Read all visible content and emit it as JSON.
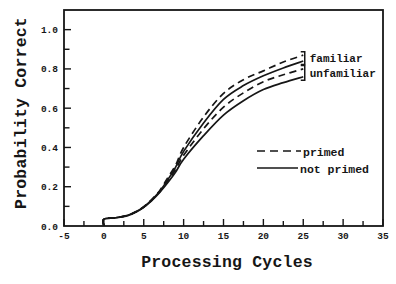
{
  "figure": {
    "background": "#ffffff",
    "ink_color": "#161616"
  },
  "chart_data": {
    "type": "line",
    "title": "",
    "xlabel": "Processing Cycles",
    "ylabel": "Probability Correct",
    "xlim": [
      -5,
      35
    ],
    "ylim": [
      0,
      1.1
    ],
    "x_tick_values": [
      -5,
      0,
      5,
      10,
      15,
      20,
      25,
      30,
      35
    ],
    "x_tick_labels": [
      "-5",
      "0",
      "5",
      "10",
      "15",
      "20",
      "25",
      "30",
      "35"
    ],
    "x_minor_tick_step": 2.5,
    "y_tick_values": [
      0,
      0.2,
      0.4,
      0.6,
      0.8,
      1.0
    ],
    "y_tick_labels": [
      "0.0",
      "0.2",
      "0.4",
      "0.6",
      "0.8",
      "1.0"
    ],
    "y_minor_tick_step": 0.1,
    "grid": false,
    "legend_position": "inside lower right",
    "legend": [
      {
        "label": "primed",
        "style": "dashed"
      },
      {
        "label": "not primed",
        "style": "solid"
      }
    ],
    "annotations": [
      {
        "label": "familiar",
        "bracket": true,
        "groups_series": [
          0,
          1
        ]
      },
      {
        "label": "unfamiliar",
        "bracket": true,
        "groups_series": [
          2,
          3
        ]
      }
    ],
    "series": [
      {
        "name": "familiar primed",
        "familiarity": "familiar",
        "priming": "primed",
        "style": "dashed",
        "points": [
          [
            0,
            0
          ],
          [
            0,
            0.035
          ],
          [
            1.5,
            0.042
          ],
          [
            3,
            0.055
          ],
          [
            4,
            0.072
          ],
          [
            5,
            0.098
          ],
          [
            6,
            0.135
          ],
          [
            7,
            0.18
          ],
          [
            8,
            0.245
          ],
          [
            9,
            0.31
          ],
          [
            10,
            0.4
          ],
          [
            12.5,
            0.555
          ],
          [
            15,
            0.675
          ],
          [
            17.5,
            0.745
          ],
          [
            20,
            0.79
          ],
          [
            22.5,
            0.835
          ],
          [
            25,
            0.87
          ]
        ]
      },
      {
        "name": "familiar not primed",
        "familiarity": "familiar",
        "priming": "not primed",
        "style": "solid",
        "points": [
          [
            0,
            0
          ],
          [
            0,
            0.035
          ],
          [
            1.5,
            0.042
          ],
          [
            3,
            0.055
          ],
          [
            4,
            0.072
          ],
          [
            5,
            0.097
          ],
          [
            6,
            0.133
          ],
          [
            7,
            0.177
          ],
          [
            8,
            0.235
          ],
          [
            9,
            0.3
          ],
          [
            10,
            0.38
          ],
          [
            12.5,
            0.525
          ],
          [
            15,
            0.645
          ],
          [
            17.5,
            0.715
          ],
          [
            20,
            0.765
          ],
          [
            22.5,
            0.805
          ],
          [
            25,
            0.84
          ]
        ]
      },
      {
        "name": "unfamiliar primed",
        "familiarity": "unfamiliar",
        "priming": "primed",
        "style": "dashed",
        "points": [
          [
            0,
            0
          ],
          [
            0,
            0.035
          ],
          [
            1.5,
            0.042
          ],
          [
            3,
            0.054
          ],
          [
            4,
            0.071
          ],
          [
            5,
            0.096
          ],
          [
            6,
            0.131
          ],
          [
            7,
            0.174
          ],
          [
            8,
            0.228
          ],
          [
            9,
            0.288
          ],
          [
            10,
            0.36
          ],
          [
            12.5,
            0.495
          ],
          [
            15,
            0.605
          ],
          [
            17.5,
            0.678
          ],
          [
            20,
            0.735
          ],
          [
            22.5,
            0.77
          ],
          [
            25,
            0.8
          ]
        ]
      },
      {
        "name": "unfamiliar not primed",
        "familiarity": "unfamiliar",
        "priming": "not primed",
        "style": "solid",
        "points": [
          [
            0,
            0
          ],
          [
            0,
            0.035
          ],
          [
            1.5,
            0.042
          ],
          [
            3,
            0.053
          ],
          [
            4,
            0.07
          ],
          [
            5,
            0.095
          ],
          [
            6,
            0.129
          ],
          [
            7,
            0.171
          ],
          [
            8,
            0.22
          ],
          [
            9,
            0.275
          ],
          [
            10,
            0.34
          ],
          [
            12.5,
            0.46
          ],
          [
            15,
            0.565
          ],
          [
            17.5,
            0.638
          ],
          [
            20,
            0.695
          ],
          [
            22.5,
            0.73
          ],
          [
            25,
            0.76
          ]
        ]
      }
    ]
  }
}
